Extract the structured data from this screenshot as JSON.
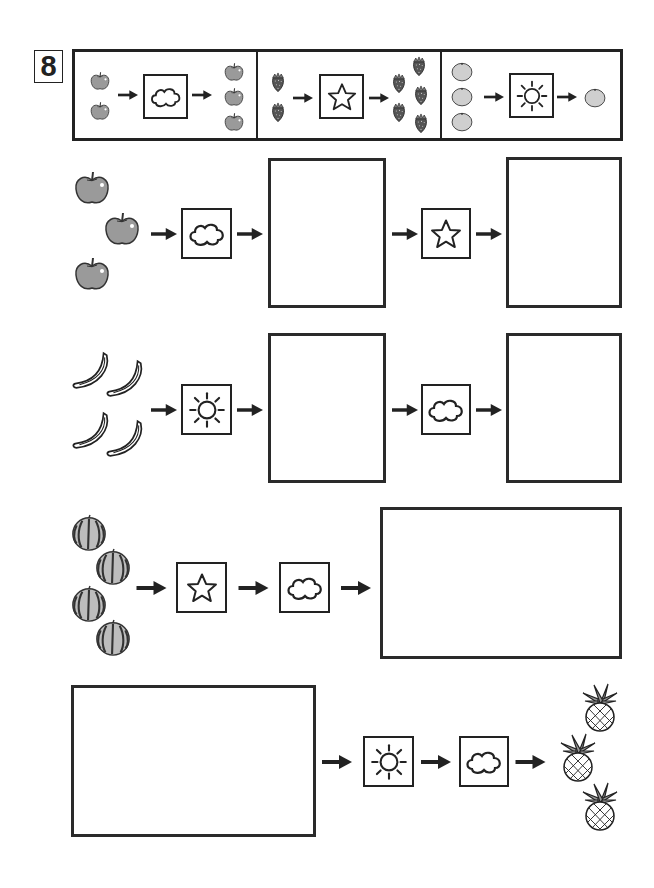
{
  "worksheet": {
    "problem_number": "8",
    "legend": {
      "title": "example-rules",
      "rules": [
        {
          "symbol": "cloud",
          "input": {
            "fruit": "apple",
            "count": 2
          },
          "output": {
            "fruit": "apple",
            "count": 3
          }
        },
        {
          "symbol": "star",
          "input": {
            "fruit": "strawberry",
            "count": 2
          },
          "output": {
            "fruit": "strawberry",
            "count": 5
          }
        },
        {
          "symbol": "sun",
          "input": {
            "fruit": "orange",
            "count": 3
          },
          "output": {
            "fruit": "orange",
            "count": 1
          }
        }
      ]
    },
    "puzzles": [
      {
        "row": 1,
        "start": {
          "fruit": "apple",
          "count": 3
        },
        "steps": [
          "cloud",
          "answer-box",
          "star",
          "answer-box"
        ]
      },
      {
        "row": 2,
        "start": {
          "fruit": "banana",
          "count": 4
        },
        "steps": [
          "sun",
          "answer-box",
          "cloud",
          "answer-box"
        ]
      },
      {
        "row": 3,
        "start": {
          "fruit": "watermelon",
          "count": 4
        },
        "steps": [
          "star",
          "cloud",
          "answer-box"
        ]
      },
      {
        "row": 4,
        "start": "answer-box",
        "steps": [
          "sun",
          "cloud"
        ],
        "end": {
          "fruit": "pineapple",
          "count": 3
        }
      }
    ]
  },
  "colors": {
    "ink": "#222222",
    "apple_fill": "#9a9a9a",
    "orange_fill": "#cfcfcf",
    "strawberry_fill": "#555555",
    "paper": "#ffffff"
  }
}
